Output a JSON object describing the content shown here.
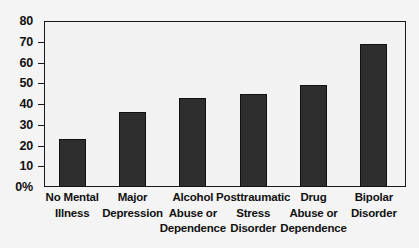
{
  "chart_data": {
    "type": "bar",
    "title": "",
    "subtitle": "",
    "xlabel": "",
    "ylabel": "",
    "ylim": [
      0,
      80
    ],
    "ytick_labels": [
      "80",
      "70",
      "60",
      "50",
      "40",
      "30",
      "20",
      "10",
      "0%"
    ],
    "ytick_values": [
      80,
      70,
      60,
      50,
      40,
      30,
      20,
      10,
      0
    ],
    "grid": false,
    "legend": null,
    "categories": [
      "No Mental Illness",
      "Major Depression",
      "Alcohol Abuse or Dependence",
      "Posttraumatic Stress Disorder",
      "Drug Abuse or Dependence",
      "Bipolar Disorder"
    ],
    "category_label_lines": [
      [
        "No Mental",
        "Illness"
      ],
      [
        "Major",
        "Depression"
      ],
      [
        "Alcohol",
        "Abuse or",
        "Dependence"
      ],
      [
        "Posttraumatic",
        "Stress",
        "Disorder"
      ],
      [
        "Drug",
        "Abuse or",
        "Dependence"
      ],
      [
        "Bipolar",
        "Disorder"
      ]
    ],
    "values": [
      23,
      36,
      43,
      45,
      49,
      69
    ],
    "bar_color": "#2e2e2e",
    "plot_background": "#f2f2f2",
    "axis_color": "#1a1a1a"
  }
}
